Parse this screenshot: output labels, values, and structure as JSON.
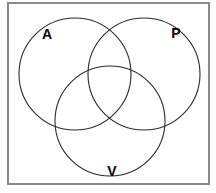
{
  "figure": {
    "kind": "venn-diagram",
    "canvas": {
      "width": 216,
      "height": 193,
      "background": "#ffffff"
    },
    "frame": {
      "name": "diagram-border",
      "x": 8,
      "y": 3,
      "width": 201,
      "height": 181,
      "stroke": "#8a8a8a",
      "stroke_width": 2
    },
    "style": {
      "circle_stroke": "#2b2b2b",
      "circle_stroke_width": 1.1,
      "label_color": "#000000",
      "label_font_size": 14
    },
    "sets": [
      {
        "id": "A",
        "label": "A",
        "cx": 75,
        "cy": 74,
        "r": 56,
        "label_x": 47,
        "label_y": 35,
        "label_anchor": "middle"
      },
      {
        "id": "P",
        "label": "P",
        "cx": 144,
        "cy": 74,
        "r": 56,
        "label_x": 176,
        "label_y": 34,
        "label_anchor": "middle"
      },
      {
        "id": "V",
        "label": "V",
        "cx": 110,
        "cy": 121,
        "r": 55,
        "label_x": 112,
        "label_y": 172,
        "label_anchor": "middle"
      }
    ]
  }
}
